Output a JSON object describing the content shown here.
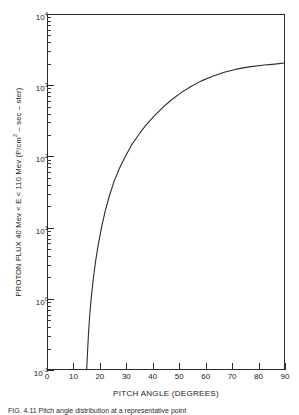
{
  "chart_data": {
    "type": "line",
    "title": "",
    "xlabel": "PITCH ANGLE (DEGREES)",
    "ylabel": "PROTON FLUX 40 Mev < E < 110 Mev (P/cm² – sec – ster)",
    "ylabel_parts": {
      "pre": "PROTON FLUX 40 Mev < E < 110 Mev (P/cm",
      "sup": "2",
      "post": " – sec – ster)"
    },
    "xscale": "linear",
    "yscale": "log",
    "xlim": [
      0,
      90
    ],
    "ylim": [
      0.1,
      10000
    ],
    "grid": false,
    "legend": null,
    "xticks": [
      0,
      10,
      20,
      30,
      40,
      50,
      60,
      70,
      80,
      90
    ],
    "xticklabels": [
      "0",
      "10",
      "20",
      "30",
      "40",
      "50",
      "60",
      "70",
      "80",
      "90"
    ],
    "yticks": [
      0.1,
      1,
      10,
      100,
      1000,
      10000
    ],
    "yticklabels": [
      "10⁻¹",
      "10⁰",
      "10¹",
      "10²",
      "10³",
      "10⁴"
    ],
    "ytick_mantissas": [
      "10",
      "10",
      "10",
      "10",
      "10",
      "10"
    ],
    "ytick_exponents": [
      "-1",
      "0",
      "1",
      "2",
      "3",
      "4"
    ],
    "series": [
      {
        "name": "proton flux vs pitch angle",
        "x": [
          15.0,
          15.3,
          15.7,
          16.2,
          16.8,
          17.5,
          18.4,
          19.4,
          20.6,
          22.0,
          23.6,
          25.4,
          27.4,
          29.6,
          32.0,
          34.6,
          37.4,
          40.4,
          43.6,
          47.0,
          50.6,
          54.4,
          58.4,
          62.6,
          67.0,
          71.6,
          76.4,
          81.4,
          86.0,
          90.0
        ],
        "y": [
          0.1,
          0.17,
          0.33,
          0.62,
          1.1,
          1.9,
          3.4,
          5.8,
          10.0,
          17.0,
          28.0,
          45.0,
          68.0,
          100.0,
          145.0,
          200.0,
          275.0,
          365.0,
          480.0,
          620.0,
          780.0,
          960.0,
          1150.0,
          1340.0,
          1520.0,
          1680.0,
          1810.0,
          1910.0,
          1975.0,
          2050.0
        ]
      }
    ],
    "annotations": []
  },
  "axes": {
    "x_tick_labels": [
      "0",
      "10",
      "20",
      "30",
      "40",
      "50",
      "60",
      "70",
      "80",
      "90"
    ],
    "y_decade_labels": [
      {
        "mantissa": "10",
        "exponent": "4"
      },
      {
        "mantissa": "10",
        "exponent": "3"
      },
      {
        "mantissa": "10",
        "exponent": "2"
      },
      {
        "mantissa": "10",
        "exponent": "1"
      },
      {
        "mantissa": "10",
        "exponent": "0"
      },
      {
        "mantissa": "10",
        "exponent": "-1"
      }
    ]
  },
  "titles": {
    "x_axis": "PITCH ANGLE (DEGREES)",
    "y_axis_pre": "PROTON FLUX 40 Mev < E < 110 Mev (P/cm",
    "y_axis_sup": "2",
    "y_axis_post": " – sec – ster)"
  },
  "caption": "FIG.  4.11    Pitch  angle  distribution  at  a  representative  point"
}
